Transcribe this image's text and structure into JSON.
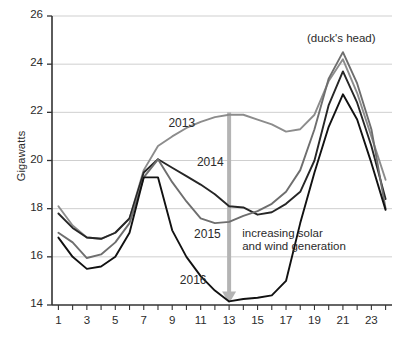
{
  "chart_data": {
    "type": "line",
    "title": "",
    "xlabel": "",
    "ylabel": "Gigawatts",
    "xlim": [
      0,
      24
    ],
    "ylim": [
      14,
      26
    ],
    "ytick_step": 2,
    "grid": true,
    "legend": "inline-labels",
    "x": [
      1,
      2,
      3,
      4,
      5,
      6,
      7,
      8,
      9,
      10,
      11,
      12,
      13,
      14,
      15,
      16,
      17,
      18,
      19,
      20,
      21,
      22,
      23,
      24
    ],
    "xticks_labeled": [
      "1",
      "3",
      "5",
      "7",
      "9",
      "11",
      "13",
      "15",
      "17",
      "19",
      "21",
      "23"
    ],
    "yticks": [
      "14",
      "16",
      "18",
      "20",
      "22",
      "24",
      "26"
    ],
    "series": [
      {
        "name": "2013",
        "color": "#8c8c8c",
        "values": [
          18.1,
          17.3,
          16.8,
          16.75,
          17.0,
          17.6,
          19.6,
          20.6,
          21.0,
          21.35,
          21.6,
          21.8,
          21.9,
          21.9,
          21.7,
          21.5,
          21.2,
          21.3,
          21.9,
          23.3,
          24.2,
          22.8,
          21.0,
          19.2
        ]
      },
      {
        "name": "2014",
        "color": "#262626",
        "values": [
          17.8,
          17.2,
          16.8,
          16.75,
          17.0,
          17.6,
          19.5,
          20.05,
          19.7,
          19.35,
          19.0,
          18.6,
          18.1,
          18.05,
          17.75,
          17.85,
          18.2,
          18.7,
          20.0,
          22.3,
          23.7,
          22.4,
          20.6,
          18.4
        ]
      },
      {
        "name": "2015",
        "color": "#6e6e6e",
        "values": [
          17.0,
          16.6,
          15.95,
          16.1,
          16.6,
          17.4,
          19.3,
          20.05,
          19.1,
          18.3,
          17.6,
          17.4,
          17.45,
          17.7,
          17.9,
          18.2,
          18.7,
          19.6,
          21.3,
          23.4,
          24.5,
          23.2,
          21.3,
          18.0
        ]
      },
      {
        "name": "2016",
        "color": "#111111",
        "values": [
          16.8,
          16.0,
          15.5,
          15.6,
          16.0,
          17.0,
          19.3,
          19.3,
          17.1,
          16.0,
          15.2,
          14.6,
          14.15,
          14.25,
          14.3,
          14.4,
          15.0,
          17.4,
          19.5,
          21.4,
          22.75,
          21.7,
          19.9,
          17.95
        ]
      }
    ],
    "annotations": [
      {
        "name": "ducks-head",
        "text": "(duck's head)",
        "x": 21,
        "y": 25.0
      },
      {
        "name": "increasing-generation",
        "line1": "increasing solar",
        "line2": "and wind generation",
        "x": 13.5,
        "y": 17.0
      },
      {
        "name": "down-arrow",
        "from_x": 13,
        "from_y": 22.0,
        "to_x": 13,
        "to_y": 14.1,
        "color": "#b4b4b4"
      }
    ],
    "series_labels": [
      {
        "name": "2013",
        "x": 10.0,
        "y": 21.5
      },
      {
        "name": "2014",
        "x": 12.0,
        "y": 19.9
      },
      {
        "name": "2015",
        "x": 11.8,
        "y": 16.9
      },
      {
        "name": "2016",
        "x": 10.8,
        "y": 15.0
      }
    ]
  },
  "axis": {
    "y_title": "Gigawatts",
    "y_ticks": [
      "26",
      "24",
      "22",
      "20",
      "18",
      "16",
      "14"
    ],
    "x_ticks": [
      "1",
      "3",
      "5",
      "7",
      "9",
      "11",
      "13",
      "15",
      "17",
      "19",
      "21",
      "23"
    ]
  },
  "labels": {
    "s2013": "2013",
    "s2014": "2014",
    "s2015": "2015",
    "s2016": "2016",
    "ducks_head": "(duck's head)",
    "note_line1": "increasing solar",
    "note_line2": "and wind generation"
  }
}
